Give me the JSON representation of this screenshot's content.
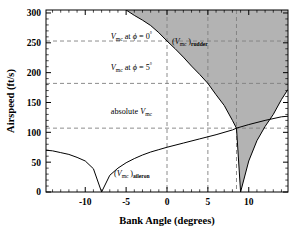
{
  "chart_data": {
    "type": "line",
    "title": "",
    "xlabel": "Bank Angle (degrees)",
    "ylabel": "Airspeed (ft/s)",
    "xlim": [
      -14.8,
      14.8
    ],
    "ylim": [
      0,
      305
    ],
    "xticks": [
      -10,
      -5,
      0,
      5,
      10
    ],
    "xticklabels": [
      "-10",
      "-5",
      "0",
      "5",
      "10"
    ],
    "yticks": [
      0,
      50,
      100,
      150,
      200,
      250,
      300
    ],
    "yticklabels": [
      "0",
      "50",
      "100",
      "150",
      "200",
      "250",
      "300"
    ],
    "grid": false,
    "legend_position": "inline-annotations",
    "series": [
      {
        "name": "(Vmc)rudder",
        "label": "(V_mc)_rudder",
        "description": "Rudder-limited minimum control speed; decreasing curve that passes off the top of the plot near phi = -5 deg, falls to about 253 ft/s at phi = 0 deg, 182 ft/s at phi = 5 deg, reaches a minimum of about 107 ft/s near phi = 8.5 deg, then rises again toward the right edge.",
        "x": [
          -5.0,
          -4.0,
          -3.0,
          -2.0,
          -1.0,
          0.0,
          1.0,
          2.0,
          3.0,
          4.0,
          5.0,
          6.0,
          7.0,
          8.0,
          8.5,
          9.0,
          10.0,
          11.0,
          12.0,
          13.0,
          14.0,
          14.8
        ],
        "y": [
          305,
          296,
          288,
          279,
          267,
          253,
          240,
          226,
          211,
          197,
          182,
          163,
          145,
          120,
          107,
          0,
          52,
          86,
          110,
          130,
          155,
          172
        ]
      },
      {
        "name": "(Vmc)aileron",
        "label": "(V_mc)_aileron",
        "description": "Aileron-limited minimum control speed; starts near 70 ft/s at the left edge, drops to 0 ft/s at phi = -8 deg, then rises monotonically through about 75 ft/s at phi = 0 deg and 107 ft/s at the crossing near phi = 8.5 deg, reaching about 127 ft/s at the right edge.",
        "x": [
          -14.8,
          -14.0,
          -13.0,
          -12.0,
          -11.0,
          -10.0,
          -9.0,
          -8.0,
          -7.0,
          -6.0,
          -5.0,
          -4.0,
          -3.0,
          -2.0,
          -1.0,
          0.0,
          2.0,
          4.0,
          6.0,
          8.0,
          8.5,
          10.0,
          12.0,
          14.0,
          14.8
        ],
        "y": [
          70,
          69,
          66,
          63,
          58,
          52,
          39,
          0,
          28,
          40,
          49,
          56,
          62,
          67,
          71,
          75,
          82,
          89,
          96,
          104,
          107,
          113,
          120,
          126,
          127
        ]
      }
    ],
    "shaded_region": {
      "name": "loss-of-control-region",
      "fill_color": "#b3b3b3",
      "description": "Grey filled region above the (Vmc)rudder curve, bounded on the right by the rising branch of the rudder curve."
    },
    "reference_lines": [
      {
        "name": "vmc-phi-0-line",
        "orientation": "horizontal",
        "value": 253,
        "label": "V_mc at phi = 0 deg",
        "style": "dashed",
        "color": "#808080"
      },
      {
        "name": "vmc-phi-5-line",
        "orientation": "horizontal",
        "value": 182,
        "label": "V_mc at phi = 5 deg",
        "style": "dashed",
        "color": "#808080"
      },
      {
        "name": "absolute-vmc-line",
        "orientation": "horizontal",
        "value": 107,
        "label": "absolute V_mc",
        "style": "dashed",
        "color": "#808080"
      },
      {
        "name": "phi-0-vertical",
        "orientation": "vertical",
        "value": 0,
        "label": "",
        "style": "dashed",
        "color": "#808080"
      },
      {
        "name": "phi-5-vertical",
        "orientation": "vertical",
        "value": 5,
        "label": "",
        "style": "dashed",
        "color": "#808080"
      },
      {
        "name": "phi-8p5-vertical",
        "orientation": "vertical",
        "value": 8.5,
        "label": "",
        "style": "dashed",
        "color": "#808080"
      }
    ],
    "annotations": [
      {
        "name": "annotation-vmc-phi-0",
        "text_parts": {
          "var": "V",
          "sub": "mc",
          "mid": " at ",
          "phi": "ϕ",
          "eq": " = 0",
          "deg": "°"
        },
        "x": -3.5,
        "y": 258
      },
      {
        "name": "annotation-vmc-phi-5",
        "text_parts": {
          "var": "V",
          "sub": "mc",
          "mid": " at ",
          "phi": "ϕ",
          "eq": " = 5",
          "deg": "°"
        },
        "x": -3.5,
        "y": 188
      },
      {
        "name": "annotation-absolute-vmc",
        "text_parts": {
          "pre": "absolute ",
          "var": "V",
          "sub": "mc"
        },
        "x": -3.5,
        "y": 113
      },
      {
        "name": "annotation-rudder-curve",
        "text_parts": {
          "open": "(",
          "var": "V",
          "sub": "mc",
          "close": ")",
          "sub2": "rudder"
        },
        "x": 0.6,
        "y": 250
      },
      {
        "name": "annotation-aileron-curve",
        "text_parts": {
          "open": "(",
          "var": "V",
          "sub": "mc",
          "close": ")",
          "sub2": "aileron"
        },
        "x": -3.4,
        "y": 33
      }
    ]
  },
  "axes": {
    "x_title": "Bank Angle (degrees)",
    "y_title": "Airspeed (ft/s)"
  }
}
